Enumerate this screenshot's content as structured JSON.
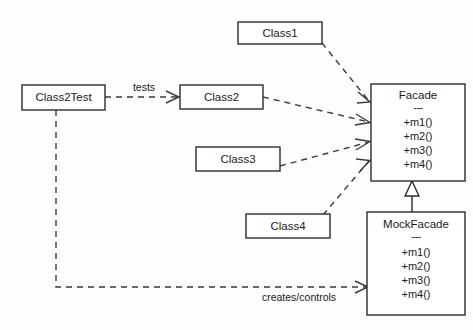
{
  "diagram": {
    "background_color": "#fdfdfd",
    "line_color": "#3a3a3a",
    "box_stroke_color": "#2b2b2b",
    "box_fill_color": "#ffffff",
    "text_color": "#1a1a1a"
  },
  "classes": {
    "class1": {
      "name": "Class1"
    },
    "class2": {
      "name": "Class2"
    },
    "class3": {
      "name": "Class3"
    },
    "class4": {
      "name": "Class4"
    },
    "class2test": {
      "name": "Class2Test"
    },
    "facade": {
      "name": "Facade",
      "separator": "---",
      "members": [
        "+m1()",
        "+m2()",
        "+m3()",
        "+m4()"
      ]
    },
    "mockfacade": {
      "name": "MockFacade",
      "separator": "---",
      "members": [
        "+m1()",
        "+m2()",
        "+m3()",
        "+m4()"
      ]
    }
  },
  "edges": {
    "tests_label": "tests",
    "creates_controls_label": "creates/controls"
  }
}
